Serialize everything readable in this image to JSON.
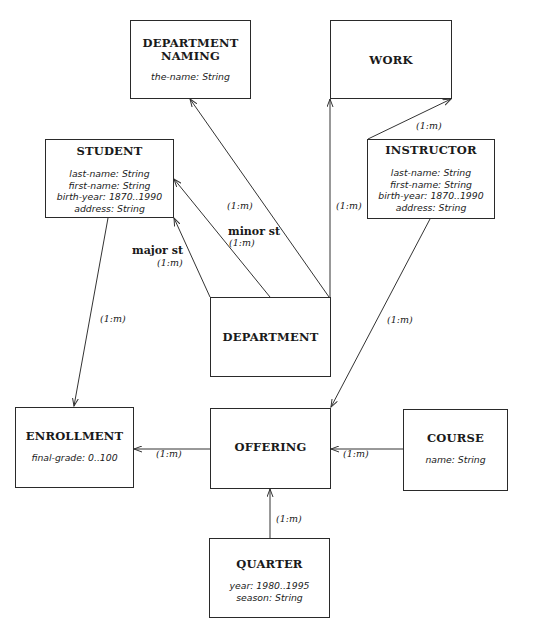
{
  "entities": {
    "department_naming": {
      "title_line1": "DEPARTMENT",
      "title_line2": "NAMING",
      "attributes": [
        "the-name: String"
      ]
    },
    "work": {
      "title": "WORK",
      "attributes": []
    },
    "student": {
      "title": "STUDENT",
      "attributes": [
        "last-name: String",
        "first-name: String",
        "birth-year: 1870..1990",
        "address: String"
      ]
    },
    "instructor": {
      "title": "INSTRUCTOR",
      "attributes": [
        "last-name: String",
        "first-name: String",
        "birth-year: 1870..1990",
        "address: String"
      ]
    },
    "department": {
      "title": "DEPARTMENT",
      "attributes": []
    },
    "enrollment": {
      "title": "ENROLLMENT",
      "attributes": [
        "final-grade: 0..100"
      ]
    },
    "offering": {
      "title": "OFFERING",
      "attributes": []
    },
    "course": {
      "title": "COURSE",
      "attributes": [
        "name: String"
      ]
    },
    "quarter": {
      "title": "QUARTER",
      "attributes": [
        "year: 1980..1995",
        "season: String"
      ]
    }
  },
  "relationships": [
    {
      "from": "DEPARTMENT",
      "to": "DEPARTMENT NAMING",
      "cardinality": "(1:m)"
    },
    {
      "from": "DEPARTMENT",
      "to": "WORK",
      "cardinality": "(1:m)"
    },
    {
      "from": "DEPARTMENT",
      "to": "STUDENT",
      "name": "major st",
      "cardinality": "(1:m)"
    },
    {
      "from": "DEPARTMENT",
      "to": "STUDENT",
      "name": "minor st",
      "cardinality": "(1:m)"
    },
    {
      "from": "INSTRUCTOR",
      "to": "WORK",
      "cardinality": "(1:m)"
    },
    {
      "from": "INSTRUCTOR",
      "to": "OFFERING",
      "cardinality": "(1:m)"
    },
    {
      "from": "STUDENT",
      "to": "ENROLLMENT",
      "cardinality": "(1:m)"
    },
    {
      "from": "OFFERING",
      "to": "ENROLLMENT",
      "cardinality": "(1:m)"
    },
    {
      "from": "COURSE",
      "to": "OFFERING",
      "cardinality": "(1:m)"
    },
    {
      "from": "QUARTER",
      "to": "OFFERING",
      "cardinality": "(1:m)"
    }
  ],
  "labels": {
    "card": "(1:m)",
    "major": "major st",
    "minor": "minor st"
  }
}
